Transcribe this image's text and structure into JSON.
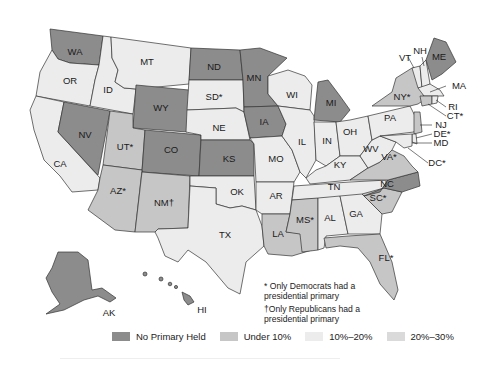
{
  "map": {
    "colors": {
      "no_primary": "#8c8c8c",
      "under_10": "#c6c6c6",
      "p10_20": "#ececec",
      "p20_30": "#dadada",
      "stroke": "#333333"
    },
    "states": [
      {
        "abbr": "WA",
        "label": "WA",
        "category": "no_primary"
      },
      {
        "abbr": "OR",
        "label": "OR",
        "category": "p10_20"
      },
      {
        "abbr": "CA",
        "label": "CA",
        "category": "p10_20"
      },
      {
        "abbr": "ID",
        "label": "ID",
        "category": "p10_20"
      },
      {
        "abbr": "NV",
        "label": "NV",
        "category": "no_primary"
      },
      {
        "abbr": "MT",
        "label": "MT",
        "category": "p10_20"
      },
      {
        "abbr": "WY",
        "label": "WY",
        "category": "no_primary"
      },
      {
        "abbr": "UT",
        "label": "UT*",
        "category": "under_10"
      },
      {
        "abbr": "AZ",
        "label": "AZ*",
        "category": "under_10"
      },
      {
        "abbr": "CO",
        "label": "CO",
        "category": "no_primary"
      },
      {
        "abbr": "NM",
        "label": "NM†",
        "category": "under_10"
      },
      {
        "abbr": "ND",
        "label": "ND",
        "category": "no_primary"
      },
      {
        "abbr": "SD",
        "label": "SD*",
        "category": "p10_20"
      },
      {
        "abbr": "NE",
        "label": "NE",
        "category": "p10_20"
      },
      {
        "abbr": "KS",
        "label": "KS",
        "category": "no_primary"
      },
      {
        "abbr": "OK",
        "label": "OK",
        "category": "p10_20"
      },
      {
        "abbr": "TX",
        "label": "TX",
        "category": "p10_20"
      },
      {
        "abbr": "MN",
        "label": "MN",
        "category": "no_primary"
      },
      {
        "abbr": "IA",
        "label": "IA",
        "category": "no_primary"
      },
      {
        "abbr": "MO",
        "label": "MO",
        "category": "p10_20"
      },
      {
        "abbr": "AR",
        "label": "AR",
        "category": "p10_20"
      },
      {
        "abbr": "LA",
        "label": "LA",
        "category": "under_10"
      },
      {
        "abbr": "WI",
        "label": "WI",
        "category": "p10_20"
      },
      {
        "abbr": "IL",
        "label": "IL",
        "category": "p10_20"
      },
      {
        "abbr": "MI",
        "label": "MI",
        "category": "no_primary"
      },
      {
        "abbr": "IN",
        "label": "IN",
        "category": "p10_20"
      },
      {
        "abbr": "OH",
        "label": "OH",
        "category": "p10_20"
      },
      {
        "abbr": "KY",
        "label": "KY",
        "category": "p10_20"
      },
      {
        "abbr": "TN",
        "label": "TN",
        "category": "p10_20"
      },
      {
        "abbr": "MS",
        "label": "MS*",
        "category": "under_10"
      },
      {
        "abbr": "AL",
        "label": "AL",
        "category": "p10_20"
      },
      {
        "abbr": "GA",
        "label": "GA",
        "category": "p10_20"
      },
      {
        "abbr": "FL",
        "label": "FL*",
        "category": "under_10"
      },
      {
        "abbr": "SC",
        "label": "SC*",
        "category": "under_10"
      },
      {
        "abbr": "NC",
        "label": "NC",
        "category": "no_primary"
      },
      {
        "abbr": "VA",
        "label": "VA*",
        "category": "under_10"
      },
      {
        "abbr": "WV",
        "label": "WV",
        "category": "p10_20"
      },
      {
        "abbr": "PA",
        "label": "PA",
        "category": "p10_20"
      },
      {
        "abbr": "NY",
        "label": "NY*",
        "category": "under_10"
      },
      {
        "abbr": "VT",
        "label": "VT",
        "category": "p10_20"
      },
      {
        "abbr": "NH",
        "label": "NH",
        "category": "p10_20"
      },
      {
        "abbr": "ME",
        "label": "ME",
        "category": "no_primary"
      },
      {
        "abbr": "MA",
        "label": "MA",
        "category": "p10_20"
      },
      {
        "abbr": "RI",
        "label": "RI",
        "category": "p10_20"
      },
      {
        "abbr": "CT",
        "label": "CT*",
        "category": "under_10"
      },
      {
        "abbr": "NJ",
        "label": "NJ",
        "category": "under_10"
      },
      {
        "abbr": "DE",
        "label": "DE*",
        "category": "p10_20"
      },
      {
        "abbr": "MD",
        "label": "MD",
        "category": "p10_20"
      },
      {
        "abbr": "DC",
        "label": "DC*",
        "category": "p10_20"
      },
      {
        "abbr": "AK",
        "label": "AK",
        "category": "no_primary"
      },
      {
        "abbr": "HI",
        "label": "HI",
        "category": "no_primary"
      }
    ]
  },
  "notes": {
    "dem_only": "* Only Democrats had a presidential primary",
    "rep_only": "†Only Republicans had a presidential primary"
  },
  "legend": {
    "items": [
      {
        "label": "No Primary Held",
        "color": "#8c8c8c"
      },
      {
        "label": "Under 10%",
        "color": "#c6c6c6"
      },
      {
        "label": "10%–20%",
        "color": "#ececec"
      },
      {
        "label": "20%–30%",
        "color": "#dadada"
      }
    ]
  }
}
